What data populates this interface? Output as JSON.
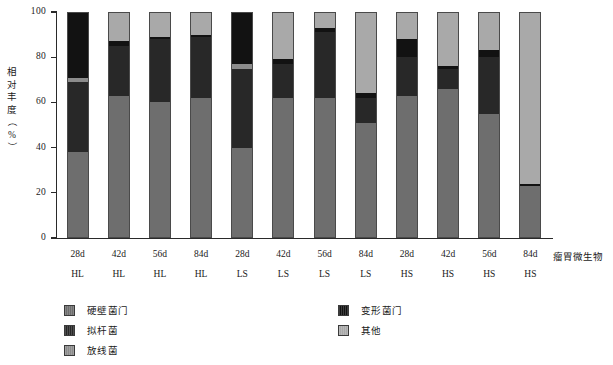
{
  "chart_data": {
    "type": "bar",
    "subtype": "stacked-bar-100",
    "title": "",
    "xlabel": "瘤胃微生物",
    "ylabel": "相对丰度（%）",
    "ylim": [
      0,
      100
    ],
    "yticks": [
      0,
      20,
      40,
      60,
      80,
      100
    ],
    "grid": false,
    "legend_position": "bottom",
    "categories": [
      "28d",
      "42d",
      "56d",
      "84d",
      "28d",
      "42d",
      "56d",
      "84d",
      "28d",
      "42d",
      "56d",
      "84d"
    ],
    "groups": [
      "HL",
      "HL",
      "HL",
      "HL",
      "LS",
      "LS",
      "LS",
      "LS",
      "HS",
      "HS",
      "HS",
      "HS"
    ],
    "series": [
      {
        "name": "硬壁菌门",
        "color": "#6e6e6e",
        "values": [
          38,
          63,
          60,
          62,
          40,
          62,
          62,
          51,
          63,
          66,
          55,
          23
        ]
      },
      {
        "name": "拟杆菌",
        "color": "#282828",
        "values": [
          31,
          22,
          28,
          27,
          35,
          15,
          29,
          11,
          17,
          9,
          25,
          0
        ]
      },
      {
        "name": "放线菌",
        "color": "#8c8c8c",
        "values": [
          2,
          0,
          0,
          0,
          2,
          0,
          0,
          0,
          0,
          0,
          0,
          0
        ]
      },
      {
        "name": "变形菌门",
        "color": "#121212",
        "values": [
          29,
          2,
          1,
          1,
          23,
          2,
          2,
          2,
          8,
          1,
          3,
          1
        ]
      },
      {
        "name": "其他",
        "color": "#a9a9a9",
        "values": [
          0,
          13,
          11,
          10,
          0,
          21,
          7,
          36,
          12,
          24,
          17,
          76
        ]
      }
    ]
  },
  "axis": {
    "y_title_chars": [
      "相",
      "对",
      "丰",
      "度",
      "（",
      "%",
      "）"
    ],
    "x_title": "瘤胃微生物"
  },
  "legend": {
    "left": [
      {
        "label": "硬壁菌门",
        "color": "#6e6e6e"
      },
      {
        "label": "拟杆菌",
        "color": "#282828"
      },
      {
        "label": "放线菌",
        "color": "#8c8c8c"
      }
    ],
    "right": [
      {
        "label": "变形菌门",
        "color": "#121212"
      },
      {
        "label": "其他",
        "color": "#a9a9a9"
      }
    ]
  }
}
